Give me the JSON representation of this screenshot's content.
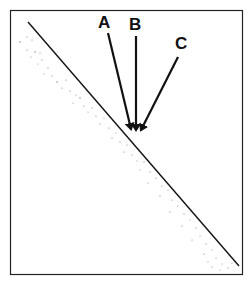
{
  "diagram": {
    "type": "incident-rays-on-surface",
    "labels": {
      "a": "A",
      "b": "B",
      "c": "C"
    },
    "colors": {
      "line": "#111111",
      "frame": "#222222",
      "stipple": "#7a7a7a",
      "background": "#ffffff"
    },
    "rays": [
      {
        "name": "A",
        "from": [
          108,
          33
        ],
        "to": [
          131,
          129
        ]
      },
      {
        "name": "B",
        "from": [
          136,
          36
        ],
        "to": [
          136,
          130
        ]
      },
      {
        "name": "C",
        "from": [
          178,
          57
        ],
        "to": [
          141,
          130
        ]
      }
    ],
    "surface_line": {
      "from": [
        28,
        22
      ],
      "to": [
        239,
        266
      ]
    }
  }
}
